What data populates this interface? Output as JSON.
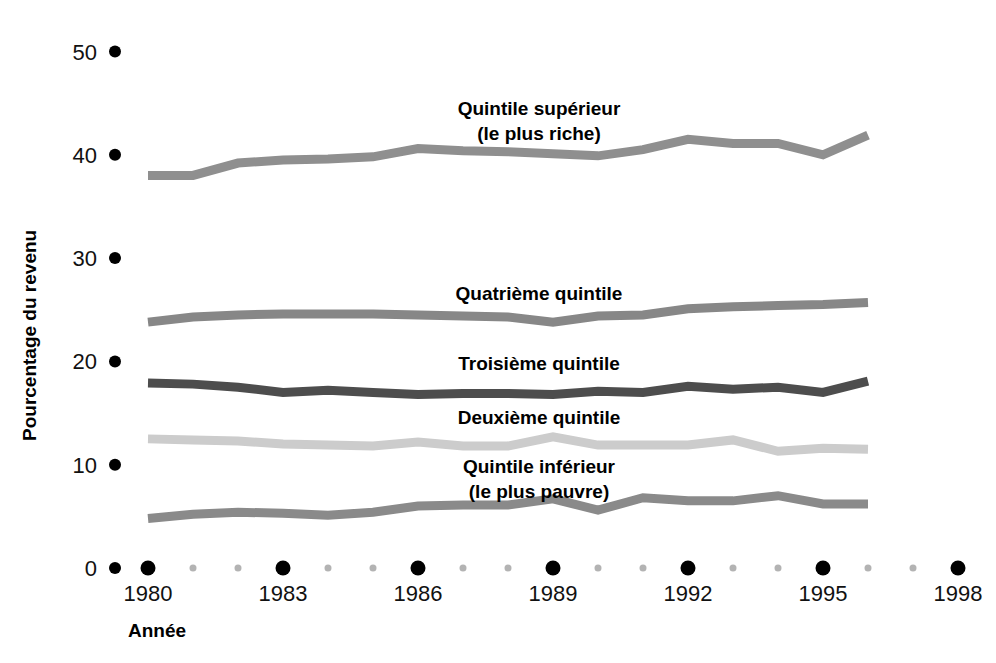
{
  "chart_data": {
    "type": "line",
    "title": "",
    "xlabel": "Année",
    "ylabel": "Pourcentage du revenu",
    "xlim": [
      1979,
      1999
    ],
    "ylim": [
      0,
      52
    ],
    "grid": false,
    "legend_position": "inline-labels",
    "y_ticks": [
      "0",
      "10",
      "20",
      "30",
      "40",
      "50"
    ],
    "y_tick_values": [
      0,
      10,
      20,
      30,
      40,
      50
    ],
    "x_ticks": [
      "1980",
      "1983",
      "1986",
      "1989",
      "1992",
      "1995",
      "1998"
    ],
    "x_tick_values": [
      1980,
      1983,
      1986,
      1989,
      1992,
      1995,
      1998
    ],
    "x_minor_values": [
      1981,
      1982,
      1984,
      1985,
      1987,
      1988,
      1990,
      1991,
      1993,
      1994,
      1996,
      1997
    ],
    "x": [
      1980,
      1981,
      1982,
      1983,
      1984,
      1985,
      1986,
      1987,
      1988,
      1989,
      1990,
      1991,
      1992,
      1993,
      1994,
      1995,
      1996
    ],
    "series": [
      {
        "name": "Quintile supérieur (le plus riche)",
        "label_line1": "Quintile supérieur",
        "label_line2": "(le plus riche)",
        "color": "#8f8f8f",
        "values": [
          38.0,
          38.0,
          39.2,
          39.5,
          39.6,
          39.8,
          40.6,
          40.4,
          40.3,
          40.1,
          39.9,
          40.5,
          41.5,
          41.1,
          41.1,
          40.0,
          41.9
        ]
      },
      {
        "name": "Quatrième quintile",
        "label_line1": "Quatrième quintile",
        "label_line2": "",
        "color": "#878787",
        "values": [
          23.8,
          24.3,
          24.5,
          24.6,
          24.6,
          24.6,
          24.5,
          24.4,
          24.3,
          23.8,
          24.4,
          24.5,
          25.1,
          25.3,
          25.4,
          25.5,
          25.7
        ]
      },
      {
        "name": "Troisième quintile",
        "label_line1": "Troisième quintile",
        "label_line2": "",
        "color": "#4d4d4d",
        "values": [
          17.9,
          17.8,
          17.5,
          17.0,
          17.2,
          17.0,
          16.8,
          16.9,
          16.9,
          16.8,
          17.1,
          17.0,
          17.6,
          17.3,
          17.5,
          17.0,
          18.1
        ]
      },
      {
        "name": "Deuxième quintile",
        "label_line1": "Deuxième quintile",
        "label_line2": "",
        "color": "#cccccc",
        "values": [
          12.5,
          12.4,
          12.3,
          12.0,
          11.9,
          11.8,
          12.2,
          11.8,
          11.8,
          12.7,
          11.9,
          11.9,
          11.9,
          12.4,
          11.3,
          11.6,
          11.5
        ]
      },
      {
        "name": "Quintile inférieur (le plus pauvre)",
        "label_line1": "Quintile inférieur",
        "label_line2": "(le plus pauvre)",
        "color": "#8a8a8a",
        "values": [
          4.8,
          5.2,
          5.4,
          5.3,
          5.1,
          5.4,
          6.0,
          6.1,
          6.1,
          6.7,
          5.6,
          6.8,
          6.5,
          6.5,
          7.0,
          6.2,
          6.2
        ]
      }
    ]
  },
  "axes": {
    "y_title": "Pourcentage du revenu",
    "x_title": "Année"
  },
  "markers": {
    "major_dot_color": "#000000",
    "minor_dot_color": "#b3b3b3"
  }
}
